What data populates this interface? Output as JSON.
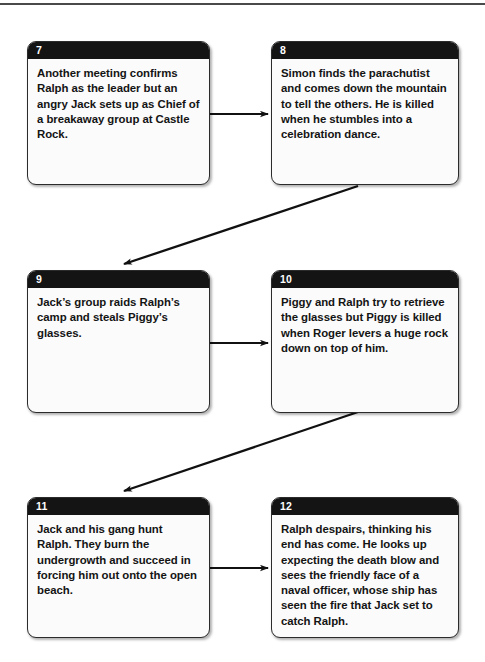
{
  "document": {
    "title": "Lord of the Flies plot summary flowchart (panels 7-12)",
    "top_rule": "horizontal-rule"
  },
  "theme": {
    "header_bg": "#141414",
    "header_text": "#ffffff",
    "box_bg": "#fbfbfb",
    "box_border": "#2b2b2b",
    "body_text": "#141414",
    "arrow_color": "#111111",
    "rule_color": "#4a4a4a"
  },
  "boxes": [
    {
      "number": "7",
      "text": "Another meeting confirms Ralph as the leader but an angry Jack sets up as Chief of a breakaway group at Castle Rock."
    },
    {
      "number": "8",
      "text": "Simon finds the parachutist and comes down the mountain to tell the others. He is killed when he stumbles into a celebration dance."
    },
    {
      "number": "9",
      "text": "Jack’s group raids Ralph’s camp and steals Piggy’s glasses."
    },
    {
      "number": "10",
      "text": "Piggy and Ralph try to retrieve the glasses but Piggy is killed when Roger levers a huge rock down on top of him."
    },
    {
      "number": "11",
      "text": "Jack and his gang hunt Ralph. They burn the undergrowth and succeed in forcing him out onto the open beach."
    },
    {
      "number": "12",
      "text": "Ralph despairs, thinking his end has come. He looks up expecting the death blow and sees the friendly face of a naval officer, whose ship has seen the fire that Jack set to catch Ralph."
    }
  ],
  "arrows": [
    {
      "name": "arrow-7-to-8",
      "kind": "horizontal",
      "from": "7",
      "to": "8"
    },
    {
      "name": "arrow-8-to-9",
      "kind": "diagonal",
      "from": "8",
      "to": "9"
    },
    {
      "name": "arrow-9-to-10",
      "kind": "horizontal",
      "from": "9",
      "to": "10"
    },
    {
      "name": "arrow-10-to-11",
      "kind": "diagonal",
      "from": "10",
      "to": "11"
    },
    {
      "name": "arrow-11-to-12",
      "kind": "horizontal",
      "from": "11",
      "to": "12"
    }
  ]
}
